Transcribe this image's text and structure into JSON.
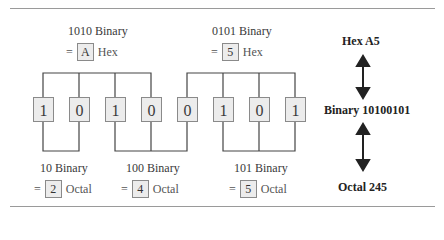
{
  "diagram": {
    "bits": [
      "1",
      "0",
      "1",
      "0",
      "0",
      "1",
      "0",
      "1"
    ],
    "hex_groups": [
      {
        "binary_label": "1010 Binary",
        "equals": "=",
        "value": "A",
        "unit": "Hex"
      },
      {
        "binary_label": "0101 Binary",
        "equals": "=",
        "value": "5",
        "unit": "Hex"
      }
    ],
    "octal_groups": [
      {
        "binary_label": "10 Binary",
        "equals": "=",
        "value": "2",
        "unit": "Octal"
      },
      {
        "binary_label": "100 Binary",
        "equals": "=",
        "value": "4",
        "unit": "Octal"
      },
      {
        "binary_label": "101 Binary",
        "equals": "=",
        "value": "5",
        "unit": "Octal"
      }
    ],
    "summary": {
      "hex": "Hex A5",
      "binary": "Binary 10100101",
      "octal": "Octal 245"
    },
    "colors": {
      "box_fill": "#ececec",
      "box_border": "#8a8a8a",
      "line": "#444444",
      "rule": "#9a9a9a"
    }
  }
}
